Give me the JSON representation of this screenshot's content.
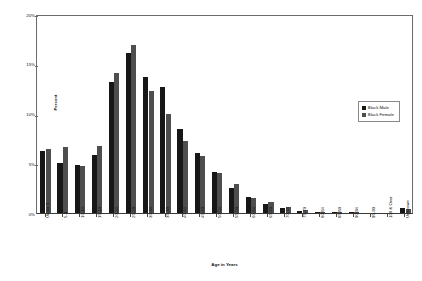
{
  "chart_data": {
    "type": "bar",
    "title": "",
    "xlabel": "Age in Years",
    "ylabel": "Percent",
    "ylim": [
      0,
      20
    ],
    "ytick_labels": [
      "20%",
      "15%",
      "10%",
      "5%",
      "0%"
    ],
    "ytick_values": [
      20,
      15,
      10,
      5,
      0
    ],
    "grid": false,
    "legend_position": "upper-right-inside",
    "categories": [
      "Under 5",
      "5-9",
      "10-14",
      "15-19",
      "20-24",
      "25-29",
      "30-34",
      "35-39",
      "40-44",
      "45-49",
      "50-54",
      "55-59",
      "60-64",
      "65-69",
      "70-74",
      "75-79",
      "80-84",
      "85-89",
      "90-94",
      "95-99",
      "100 & Over",
      "Unknown"
    ],
    "series": [
      {
        "name": "Black Male",
        "color": "#171717",
        "values": [
          6.2,
          5.0,
          4.8,
          5.8,
          13.2,
          16.1,
          13.7,
          12.7,
          8.4,
          6.0,
          4.1,
          2.5,
          1.6,
          0.9,
          0.5,
          0.25,
          0.12,
          0.04,
          0.02,
          0.0,
          0.0,
          0.55
        ]
      },
      {
        "name": "Black Female",
        "color": "#4e4e4e",
        "values": [
          6.4,
          6.6,
          4.7,
          6.7,
          14.1,
          16.9,
          12.3,
          10.0,
          7.2,
          5.7,
          4.0,
          2.9,
          1.5,
          1.1,
          0.6,
          0.35,
          0.15,
          0.05,
          0.02,
          0.0,
          0.0,
          0.4
        ]
      }
    ]
  },
  "legend": {
    "items": [
      {
        "label": "Black Male"
      },
      {
        "label": "Black Female"
      }
    ]
  },
  "axes": {
    "y_title": "Percent",
    "x_title": "Age in Years"
  }
}
